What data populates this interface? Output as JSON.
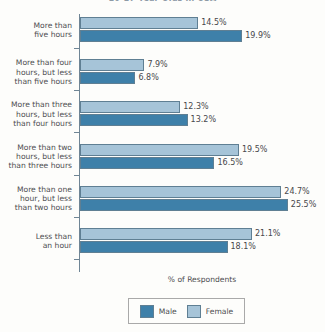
{
  "chart_data": {
    "type": "bar",
    "orientation": "horizontal",
    "title": "10-17 Year Olds in USA",
    "xlabel": "% of Respondents",
    "ylabel": "",
    "xlim": [
      0,
      30
    ],
    "grid": false,
    "legend_position": "bottom",
    "categories": [
      "More than five hours",
      "More than four hours, but less than five hours",
      "More than three hours, but less than four hours",
      "More than two hours, but less than three hours",
      "More than one hour, but less than two hours",
      "Less than an hour"
    ],
    "category_lines": [
      [
        "More than",
        "five hours"
      ],
      [
        "More than four",
        "hours, but less",
        "than five hours"
      ],
      [
        "More than three",
        "hours, but less",
        "than four hours"
      ],
      [
        "More than two",
        "hours, but less",
        "than three hours"
      ],
      [
        "More than one",
        "hour, but less",
        "than two hours"
      ],
      [
        "Less than",
        "an hour"
      ]
    ],
    "series": [
      {
        "name": "Female",
        "color": "#a6c4d8",
        "values": [
          14.5,
          7.9,
          12.3,
          19.5,
          24.7,
          21.1
        ],
        "labels": [
          "14.5%",
          "7.9%",
          "12.3%",
          "19.5%",
          "24.7%",
          "21.1%"
        ]
      },
      {
        "name": "Male",
        "color": "#3e80a9",
        "values": [
          19.9,
          6.8,
          13.2,
          16.5,
          25.5,
          18.1
        ],
        "labels": [
          "19.9%",
          "6.8%",
          "13.2%",
          "16.5%",
          "25.5%",
          "18.1%"
        ]
      }
    ]
  },
  "legend": {
    "items": [
      {
        "label": "Male",
        "swatch": "male"
      },
      {
        "label": "Female",
        "swatch": "female"
      }
    ]
  },
  "colors": {
    "male": "#3e80a9",
    "female": "#a6c4d8",
    "axis": "#6f8595",
    "text": "#4d4d50",
    "background": "#fdfdfb"
  }
}
